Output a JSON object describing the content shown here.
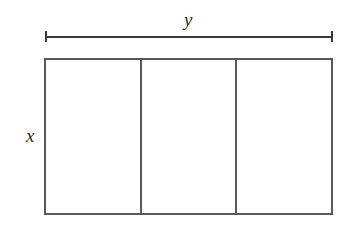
{
  "diagram": {
    "type": "rectangle-partition",
    "dimension_labels": {
      "width": "y",
      "height": "x"
    },
    "partition_count": 3,
    "cells": [
      {
        "index": 1,
        "label": ""
      },
      {
        "index": 2,
        "label": ""
      },
      {
        "index": 3,
        "label": ""
      }
    ],
    "colors": {
      "line": "#5a5a5a",
      "dimension_line": "#3a3a3a",
      "text": "#2a2a2a",
      "background": "#ffffff"
    }
  }
}
